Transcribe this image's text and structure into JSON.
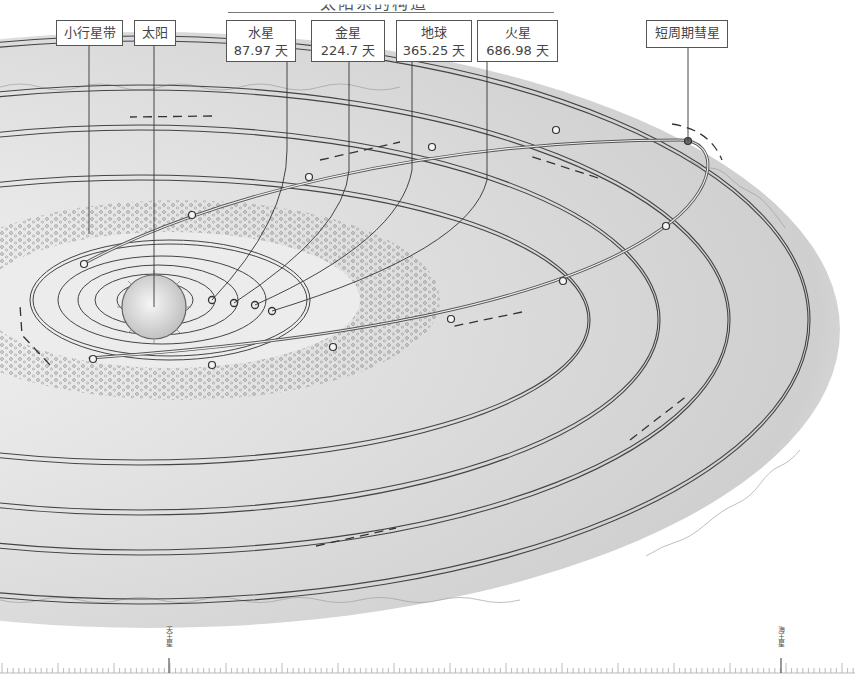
{
  "title": {
    "text": "太阳系的构造",
    "note": "only bottom edge of title glyphs visible at top of image"
  },
  "labels": {
    "asteroid_belt": "小行星带",
    "sun": "太阳",
    "comet": "短周期彗星",
    "planets": [
      {
        "name": "水星",
        "period": "87.97 天"
      },
      {
        "name": "金星",
        "period": "224.7 天"
      },
      {
        "name": "地球",
        "period": "365.25 天"
      },
      {
        "name": "火星",
        "period": "686.98 天"
      }
    ]
  },
  "scale": {
    "markers": [
      {
        "label": "天王星",
        "x": 169
      },
      {
        "label": "海王星",
        "x": 781
      }
    ]
  },
  "colors": {
    "ink": "#3a3a3a",
    "shade_dark": "#b9b9b9",
    "shade_mid": "#d6d6d6",
    "shade_light": "#ececec",
    "paper": "#ffffff"
  }
}
